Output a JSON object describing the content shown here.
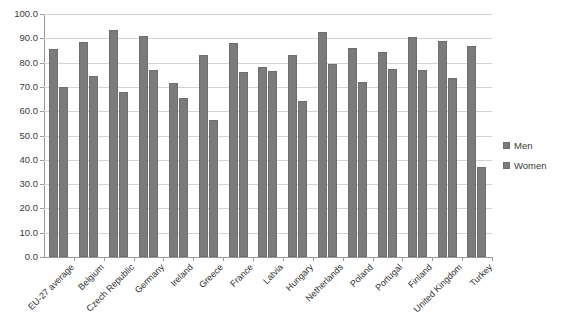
{
  "chart_data": {
    "type": "bar",
    "title": "",
    "subtitle": "",
    "xlabel": "",
    "ylabel": "",
    "ylim": [
      0.0,
      100.0
    ],
    "ytick_step": 10.0,
    "ytick_labels": [
      "100.0",
      "90.0",
      "80.0",
      "70.0",
      "60.0",
      "50.0",
      "40.0",
      "30.0",
      "20.0",
      "10.0",
      "0.0"
    ],
    "ytick_values": [
      100.0,
      90.0,
      80.0,
      70.0,
      60.0,
      50.0,
      40.0,
      30.0,
      20.0,
      10.0,
      0.0
    ],
    "grid": true,
    "grid_axis": "y",
    "legend_position": "right",
    "categories": [
      "EU-27 average",
      "Belgium",
      "Czech Republic",
      "Germany",
      "Ireland",
      "Greece",
      "France",
      "Latvia",
      "Hungary",
      "Netherlands",
      "Poland",
      "Portugal",
      "Finland",
      "United Kingdom",
      "Turkey"
    ],
    "series": [
      {
        "name": "Men",
        "color": "#7b7b7b",
        "values": [
          85.5,
          88.5,
          93.5,
          91.0,
          71.5,
          83.0,
          88.0,
          78.0,
          83.0,
          92.5,
          86.0,
          84.5,
          90.5,
          89.0,
          87.0
        ]
      },
      {
        "name": "Women",
        "color": "#7b7b7b",
        "values": [
          70.0,
          74.5,
          68.0,
          77.0,
          65.5,
          56.5,
          76.0,
          76.5,
          64.0,
          79.5,
          72.0,
          77.5,
          77.0,
          73.5,
          37.0
        ]
      }
    ]
  },
  "legend": {
    "items": [
      {
        "label": "Men"
      },
      {
        "label": "Women"
      }
    ]
  }
}
